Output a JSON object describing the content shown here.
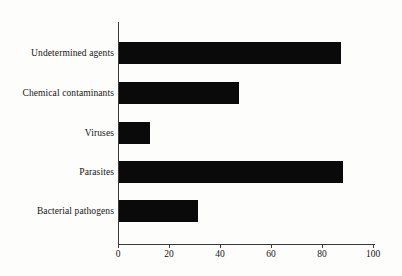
{
  "chart_data": {
    "type": "bar",
    "orientation": "horizontal",
    "title": "",
    "subtitle": "",
    "xlabel": "",
    "ylabel": "",
    "categories": [
      "Undetermined agents",
      "Chemical contaminants",
      "Viruses",
      "Parasites",
      "Bacterial pathogens"
    ],
    "values": [
      87,
      47,
      12,
      88,
      31
    ],
    "xlim": [
      0,
      100
    ],
    "xticks": [
      0,
      20,
      40,
      60,
      80,
      100
    ],
    "xtick_labels": [
      "0",
      "20",
      "40",
      "60",
      "80",
      "100"
    ],
    "grid": false,
    "legend": null,
    "bar_color": "#0a0a0a",
    "axis_color": "#3a3a3a",
    "background_color": "#fdfdfc"
  }
}
